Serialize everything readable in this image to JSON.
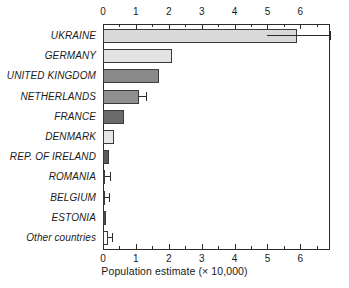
{
  "chart_data": {
    "type": "bar",
    "orientation": "horizontal",
    "title": "",
    "xlabel": "Population estimate (× 10,000)",
    "ylabel": "",
    "xlim": [
      0,
      6.9
    ],
    "xticks": [
      0,
      1,
      2,
      3,
      4,
      5,
      6
    ],
    "xtick_labels": [
      "0",
      "1",
      "2",
      "3",
      "4",
      "5",
      "6"
    ],
    "minor_tick_step": 0.5,
    "grid": false,
    "legend": null,
    "axis_positions": [
      "top",
      "bottom"
    ],
    "categories": [
      "UKRAINE",
      "GERMANY",
      "UNITED KINGDOM",
      "NETHERLANDS",
      "FRANCE",
      "DENMARK",
      "REP. OF IRELAND",
      "ROMANIA",
      "BELGIUM",
      "ESTONIA",
      "Other countries"
    ],
    "values": [
      5.9,
      2.1,
      1.7,
      1.1,
      0.65,
      0.33,
      0.17,
      0.06,
      0.05,
      0.09,
      0.15
    ],
    "error_high": [
      6.9,
      null,
      null,
      1.3,
      null,
      null,
      null,
      0.2,
      0.17,
      null,
      0.27
    ],
    "error_low": [
      5.0,
      null,
      null,
      1.1,
      null,
      null,
      null,
      0.06,
      0.05,
      null,
      0.15
    ],
    "bar_colors": [
      "#d9d9d9",
      "#e3e3e3",
      "#8a8a8a",
      "#8f8f8f",
      "#6b6b6b",
      "#e6e6e6",
      "#5a5a5a",
      "#9a9a9a",
      "#9a9a9a",
      "#4f4f4f",
      "#ffffff"
    ]
  },
  "colors": {
    "axis": "#2a2a2a",
    "text": "#1a1a1a",
    "background": "#ffffff"
  }
}
